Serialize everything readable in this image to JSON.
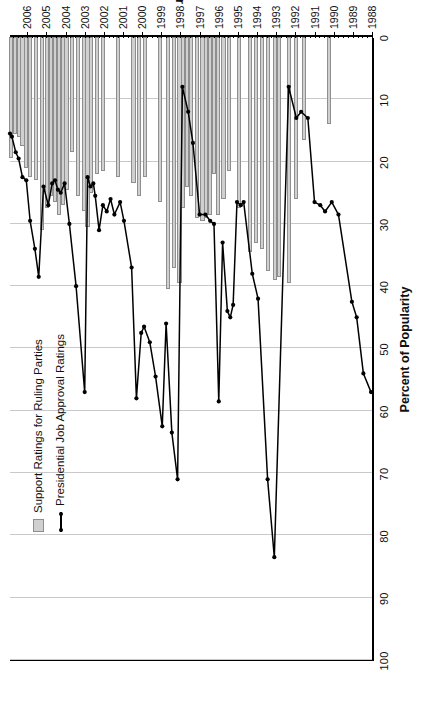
{
  "chart_data": {
    "type": "bar",
    "title": "",
    "xlabel": "Year",
    "ylabel": "Percent of Popularity",
    "ylim": [
      0,
      100
    ],
    "yticks": [
      0,
      10,
      20,
      30,
      40,
      50,
      60,
      70,
      80,
      90,
      100
    ],
    "xlim": [
      1988,
      2006.9
    ],
    "xticks": [
      1988,
      1989,
      1990,
      1991,
      1992,
      1993,
      1994,
      1995,
      1996,
      1997,
      1998,
      1999,
      2000,
      2001,
      2002,
      2003,
      2004,
      2005,
      2006
    ],
    "xticklabels": [
      "1988",
      "1989",
      "1990",
      "1991",
      "1992",
      "1993",
      "1994",
      "1995",
      "1996",
      "1997",
      "1998",
      "1999",
      "2000",
      "2001",
      "2002",
      "2003",
      "2004",
      "2005",
      "2006"
    ],
    "grid": "vertical gridlines at every 10 percent",
    "legend_position": "upper left inside plot",
    "orientation": "figure rotated 90 degrees counter-clockwise",
    "series": [
      {
        "name": "Support Ratings for Ruling Parties",
        "type": "bar",
        "color": "#d0d0d0",
        "edge_color": "#8e8e8e",
        "points": [
          {
            "x": 1990.25,
            "y": 14.0
          },
          {
            "x": 1991.55,
            "y": 16.5
          },
          {
            "x": 1991.95,
            "y": 26.0
          },
          {
            "x": 1992.35,
            "y": 39.5
          },
          {
            "x": 1992.85,
            "y": 38.5
          },
          {
            "x": 1993.05,
            "y": 39.0
          },
          {
            "x": 1993.45,
            "y": 37.5
          },
          {
            "x": 1993.75,
            "y": 34.0
          },
          {
            "x": 1994.05,
            "y": 33.0
          },
          {
            "x": 1994.35,
            "y": 34.5
          },
          {
            "x": 1994.95,
            "y": 27.5
          },
          {
            "x": 1995.45,
            "y": 21.5
          },
          {
            "x": 1995.75,
            "y": 26.0
          },
          {
            "x": 1996.05,
            "y": 28.5
          },
          {
            "x": 1996.25,
            "y": 22.0
          },
          {
            "x": 1996.45,
            "y": 28.5
          },
          {
            "x": 1996.65,
            "y": 29.0
          },
          {
            "x": 1996.85,
            "y": 29.5
          },
          {
            "x": 1997.15,
            "y": 29.0
          },
          {
            "x": 1997.45,
            "y": 25.5
          },
          {
            "x": 1997.65,
            "y": 24.0
          },
          {
            "x": 1997.85,
            "y": 27.5
          },
          {
            "x": 1998.05,
            "y": 39.5
          },
          {
            "x": 1998.35,
            "y": 37.0
          },
          {
            "x": 1998.65,
            "y": 40.5
          },
          {
            "x": 1999.05,
            "y": 26.5
          },
          {
            "x": 1999.85,
            "y": 22.5
          },
          {
            "x": 2000.15,
            "y": 25.5
          },
          {
            "x": 2000.45,
            "y": 23.5
          },
          {
            "x": 2001.25,
            "y": 22.5
          },
          {
            "x": 2002.05,
            "y": 21.5
          },
          {
            "x": 2002.35,
            "y": 22.0
          },
          {
            "x": 2002.65,
            "y": 25.0
          },
          {
            "x": 2002.85,
            "y": 30.5
          },
          {
            "x": 2003.05,
            "y": 28.0
          },
          {
            "x": 2003.35,
            "y": 25.5
          },
          {
            "x": 2003.65,
            "y": 18.5
          },
          {
            "x": 2003.95,
            "y": 24.5
          },
          {
            "x": 2004.15,
            "y": 27.0
          },
          {
            "x": 2004.35,
            "y": 28.5
          },
          {
            "x": 2004.55,
            "y": 26.5
          },
          {
            "x": 2004.75,
            "y": 25.5
          },
          {
            "x": 2004.95,
            "y": 27.5
          },
          {
            "x": 2005.25,
            "y": 31.0
          },
          {
            "x": 2005.55,
            "y": 23.0
          },
          {
            "x": 2005.85,
            "y": 22.5
          },
          {
            "x": 2006.05,
            "y": 21.0
          },
          {
            "x": 2006.25,
            "y": 17.5
          },
          {
            "x": 2006.45,
            "y": 16.0
          },
          {
            "x": 2006.65,
            "y": 15.5
          },
          {
            "x": 2006.85,
            "y": 19.5
          }
        ]
      },
      {
        "name": "Presidential Job Approval Ratings",
        "type": "line",
        "color": "#000000",
        "points": [
          {
            "x": 1988.05,
            "y": 57.0
          },
          {
            "x": 1988.45,
            "y": 54.0
          },
          {
            "x": 1988.8,
            "y": 45.0
          },
          {
            "x": 1989.05,
            "y": 42.5
          },
          {
            "x": 1989.75,
            "y": 28.5
          },
          {
            "x": 1990.1,
            "y": 26.5
          },
          {
            "x": 1990.45,
            "y": 28.0
          },
          {
            "x": 1990.7,
            "y": 27.0
          },
          {
            "x": 1991.0,
            "y": 26.5
          },
          {
            "x": 1991.35,
            "y": 13.0
          },
          {
            "x": 1991.7,
            "y": 12.0
          },
          {
            "x": 1991.95,
            "y": 13.0
          },
          {
            "x": 1992.35,
            "y": 8.0
          },
          {
            "x": 1993.1,
            "y": 83.5
          },
          {
            "x": 1993.45,
            "y": 71.0
          },
          {
            "x": 1993.95,
            "y": 42.0
          },
          {
            "x": 1994.25,
            "y": 38.0
          },
          {
            "x": 1994.7,
            "y": 26.5
          },
          {
            "x": 1994.85,
            "y": 27.0
          },
          {
            "x": 1995.05,
            "y": 26.5
          },
          {
            "x": 1995.25,
            "y": 43.0
          },
          {
            "x": 1995.4,
            "y": 45.0
          },
          {
            "x": 1995.55,
            "y": 44.0
          },
          {
            "x": 1995.8,
            "y": 33.0
          },
          {
            "x": 1996.0,
            "y": 58.5
          },
          {
            "x": 1996.25,
            "y": 30.0
          },
          {
            "x": 1996.45,
            "y": 29.5
          },
          {
            "x": 1996.7,
            "y": 28.5
          },
          {
            "x": 1997.0,
            "y": 28.5
          },
          {
            "x": 1997.35,
            "y": 17.0
          },
          {
            "x": 1997.6,
            "y": 12.0
          },
          {
            "x": 1997.9,
            "y": 8.0
          },
          {
            "x": 1998.15,
            "y": 71.0
          },
          {
            "x": 1998.45,
            "y": 63.5
          },
          {
            "x": 1998.75,
            "y": 46.0
          },
          {
            "x": 1998.95,
            "y": 62.5
          },
          {
            "x": 1999.3,
            "y": 54.5
          },
          {
            "x": 1999.6,
            "y": 49.0
          },
          {
            "x": 1999.9,
            "y": 46.5
          },
          {
            "x": 2000.05,
            "y": 47.5
          },
          {
            "x": 2000.3,
            "y": 58.0
          },
          {
            "x": 2000.55,
            "y": 37.0
          },
          {
            "x": 2000.95,
            "y": 29.5
          },
          {
            "x": 2001.15,
            "y": 26.5
          },
          {
            "x": 2001.45,
            "y": 28.5
          },
          {
            "x": 2001.65,
            "y": 26.0
          },
          {
            "x": 2001.85,
            "y": 28.0
          },
          {
            "x": 2002.05,
            "y": 27.0
          },
          {
            "x": 2002.25,
            "y": 31.0
          },
          {
            "x": 2002.45,
            "y": 25.5
          },
          {
            "x": 2002.55,
            "y": 23.5
          },
          {
            "x": 2002.7,
            "y": 24.0
          },
          {
            "x": 2002.85,
            "y": 22.5
          },
          {
            "x": 2003.0,
            "y": 57.0
          },
          {
            "x": 2003.45,
            "y": 40.0
          },
          {
            "x": 2003.8,
            "y": 30.0
          },
          {
            "x": 2004.05,
            "y": 23.5
          },
          {
            "x": 2004.25,
            "y": 25.0
          },
          {
            "x": 2004.4,
            "y": 24.5
          },
          {
            "x": 2004.55,
            "y": 23.0
          },
          {
            "x": 2004.7,
            "y": 23.5
          },
          {
            "x": 2004.9,
            "y": 27.0
          },
          {
            "x": 2005.15,
            "y": 24.0
          },
          {
            "x": 2005.4,
            "y": 38.5
          },
          {
            "x": 2005.6,
            "y": 34.0
          },
          {
            "x": 2005.85,
            "y": 29.5
          },
          {
            "x": 2006.05,
            "y": 23.0
          },
          {
            "x": 2006.25,
            "y": 22.5
          },
          {
            "x": 2006.45,
            "y": 19.5
          },
          {
            "x": 2006.6,
            "y": 18.5
          },
          {
            "x": 2006.8,
            "y": 16.0
          },
          {
            "x": 2006.9,
            "y": 15.5
          }
        ]
      }
    ]
  },
  "legend": {
    "items": [
      {
        "label": "Support Ratings for Ruling Parties",
        "marker": "bar-swatch"
      },
      {
        "label": "Presidential Job Approval Ratings",
        "marker": "line-marker"
      }
    ]
  },
  "axes": {
    "value_axis_title": "Percent of Popularity",
    "category_axis_title": "Year"
  },
  "colors": {
    "bar_fill": "#d0d0d0",
    "bar_edge": "#8e8e8e",
    "line": "#000000",
    "grid": "#c9c9c9",
    "axis": "#000000",
    "background": "#ffffff"
  }
}
